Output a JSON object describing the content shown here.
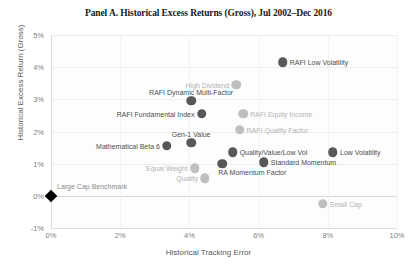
{
  "chart_data": {
    "type": "scatter",
    "title": "Panel A. Historical Excess Returns (Gross), Jul 2002–Dec 2016",
    "xlabel": "Historical Tracking Error",
    "ylabel": "Historical Excess Return (Gross)",
    "xlim": [
      0,
      10
    ],
    "ylim": [
      -1,
      5
    ],
    "xticks": [
      "0%",
      "2%",
      "4%",
      "6%",
      "8%",
      "10%"
    ],
    "xtick_values": [
      0,
      2,
      4,
      6,
      8,
      10
    ],
    "yticks": [
      "-1%",
      "0%",
      "1%",
      "2%",
      "3%",
      "4%",
      "5%"
    ],
    "ytick_values": [
      -1,
      0,
      1,
      2,
      3,
      4,
      5
    ],
    "grid": true,
    "legend": "none",
    "units": "percent",
    "colors": {
      "dark_marker": "#585858",
      "light_marker": "#bfbfbf",
      "benchmark_marker": "#000000",
      "dark_label": "#4d4d4d",
      "light_label": "#b3b3b3",
      "gridline": "#ededed",
      "axis": "#dcdcdc",
      "tick_text": "#7f7f7f"
    },
    "series": [
      {
        "name": "RAFI strategies",
        "style": "dark",
        "points": [
          {
            "label": "RAFI Low Volatility",
            "x": 6.7,
            "y": 4.15,
            "label_pos": "right"
          },
          {
            "label": "RAFI Dynamic Multi-Factor",
            "x": 4.05,
            "y": 2.95,
            "label_pos": "above"
          },
          {
            "label": "RAFI Fundamental Index",
            "x": 4.35,
            "y": 2.55,
            "label_pos": "left"
          },
          {
            "label": "Gen-1 Value",
            "x": 4.05,
            "y": 1.65,
            "label_pos": "above"
          },
          {
            "label": "Mathematical Beta 6",
            "x": 3.35,
            "y": 1.55,
            "label_pos": "left"
          },
          {
            "label": "Quality/Value/Low Vol",
            "x": 5.25,
            "y": 1.35,
            "label_pos": "right"
          },
          {
            "label": "RA Momentum Factor",
            "x": 4.95,
            "y": 1.0,
            "label_pos": "below-right"
          },
          {
            "label": "Standard Momentum",
            "x": 6.15,
            "y": 1.05,
            "label_pos": "right"
          },
          {
            "label": "Low Volatility",
            "x": 8.15,
            "y": 1.35,
            "label_pos": "right"
          }
        ]
      },
      {
        "name": "Non-RAFI strategies",
        "style": "light",
        "points": [
          {
            "label": "High Dividend",
            "x": 5.35,
            "y": 3.45,
            "label_pos": "left"
          },
          {
            "label": "RAFI Equity Income",
            "x": 5.55,
            "y": 2.55,
            "label_pos": "right"
          },
          {
            "label": "RAFI Quality Factor",
            "x": 5.45,
            "y": 2.05,
            "label_pos": "right"
          },
          {
            "label": "Equal Weight",
            "x": 4.15,
            "y": 0.85,
            "label_pos": "left"
          },
          {
            "label": "Quality",
            "x": 4.45,
            "y": 0.55,
            "label_pos": "left"
          },
          {
            "label": "Small Cap",
            "x": 7.85,
            "y": -0.25,
            "label_pos": "right"
          }
        ]
      },
      {
        "name": "Benchmark",
        "style": "diamond",
        "points": [
          {
            "label": "Large Cap Benchmark",
            "x": 0.0,
            "y": 0.0,
            "label_pos": "above-right"
          }
        ]
      }
    ]
  }
}
